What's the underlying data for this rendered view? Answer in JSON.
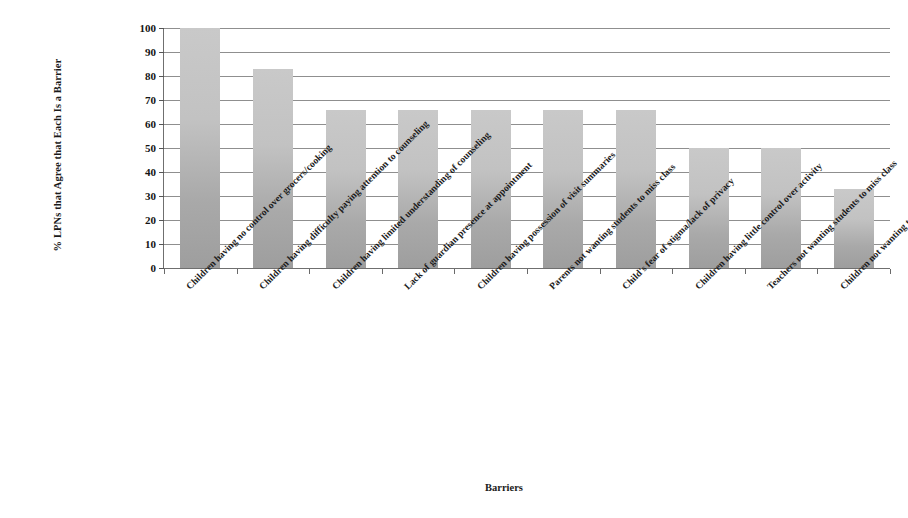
{
  "chart_data": {
    "type": "bar",
    "title": "",
    "xlabel": "Barriers",
    "ylabel": "% LPNs that Agree that Each Is a Barrier",
    "ylim": [
      0,
      100
    ],
    "ytick_step": 10,
    "yticks": [
      100,
      90,
      80,
      70,
      60,
      50,
      40,
      30,
      20,
      10,
      0
    ],
    "grid": true,
    "legend": "none",
    "bar_color": "#c0c0c0",
    "bar_color_top": "#c9c9c9",
    "bar_color_bottom": "#9e9e9e",
    "categories": [
      "Children having no control over grocers/cooking",
      "Children having difficulty paying attention to counseling",
      "Children having limited understanding of counseling",
      "Lack of guardian presence at appointment",
      "Children having possession of visit summaries",
      "Parents not wanting students to miss class",
      "Child's fear of stigma/lack of privacy",
      "Children having little control over activity",
      "Teachers not wanting students to miss class",
      "Children not wanting to miss class"
    ],
    "values": [
      100,
      83,
      66,
      66,
      66,
      66,
      66,
      50,
      50,
      33
    ]
  }
}
